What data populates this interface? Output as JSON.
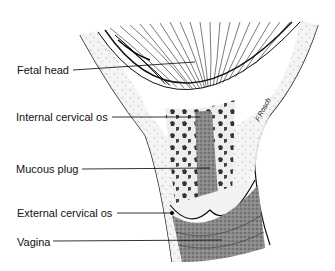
{
  "figure": {
    "labels": [
      {
        "id": "fetal-head",
        "text": "Fetal head",
        "x": 17,
        "y": 64
      },
      {
        "id": "internal-cervical-os",
        "text": "Internal cervical os",
        "x": 16,
        "y": 111
      },
      {
        "id": "mucous-plug",
        "text": "Mucous plug",
        "x": 16,
        "y": 163
      },
      {
        "id": "external-cervical-os",
        "text": "External cervical os",
        "x": 17,
        "y": 207
      },
      {
        "id": "vagina",
        "text": "Vagina",
        "x": 17,
        "y": 236
      }
    ],
    "signature": "F.Rosch"
  }
}
